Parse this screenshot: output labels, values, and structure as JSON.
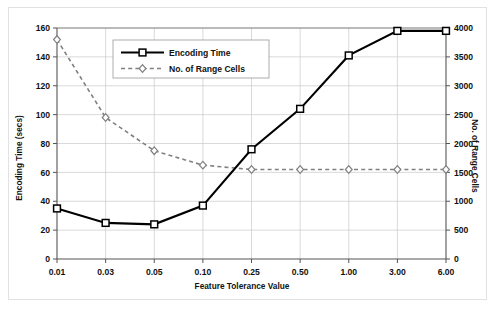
{
  "chart_data": {
    "type": "line",
    "title": "",
    "xlabel": "Feature Tolerance Value",
    "categories": [
      "0.01",
      "0.03",
      "0.05",
      "0.10",
      "0.25",
      "0.50",
      "1.00",
      "3.00",
      "6.00"
    ],
    "grid": true,
    "legend_position": "upper-left-inside",
    "axes": {
      "left": {
        "label": "Encoding Time (secs)",
        "ylim": [
          0,
          160
        ],
        "ticks": [
          0,
          20,
          40,
          60,
          80,
          100,
          120,
          140,
          160
        ],
        "tick_labels": [
          "0",
          "20",
          "40",
          "60",
          "80",
          "100",
          "120",
          "140",
          "160"
        ]
      },
      "right": {
        "label": "No. of Range Cells",
        "ylim": [
          0,
          4000
        ],
        "ticks": [
          0,
          500,
          1000,
          1500,
          2000,
          2500,
          3000,
          3500,
          4000
        ],
        "tick_labels": [
          "0",
          "500",
          "1000",
          "1500",
          "2000",
          "2500",
          "3000",
          "3500",
          "4000"
        ]
      }
    },
    "series": [
      {
        "name": "Encoding Time",
        "axis": "left",
        "style": "solid",
        "marker": "square",
        "color": "#000000",
        "values": [
          35,
          25,
          24,
          37,
          76,
          104,
          141,
          158,
          158
        ]
      },
      {
        "name": "No. of Range Cells",
        "axis": "right",
        "style": "dashed",
        "marker": "diamond",
        "color": "#808080",
        "values": [
          3800,
          2450,
          1875,
          1625,
          1550,
          1550,
          1550,
          1550,
          1550
        ]
      }
    ]
  },
  "legend": {
    "entries": [
      {
        "label": "Encoding Time"
      },
      {
        "label": "No. of Range Cells"
      }
    ]
  },
  "colors": {
    "series_primary": "#000000",
    "series_secondary": "#808080",
    "grid": "#c8c8c8",
    "axis": "#555555",
    "frame_border": "#e2e2e2",
    "background": "#ffffff"
  }
}
